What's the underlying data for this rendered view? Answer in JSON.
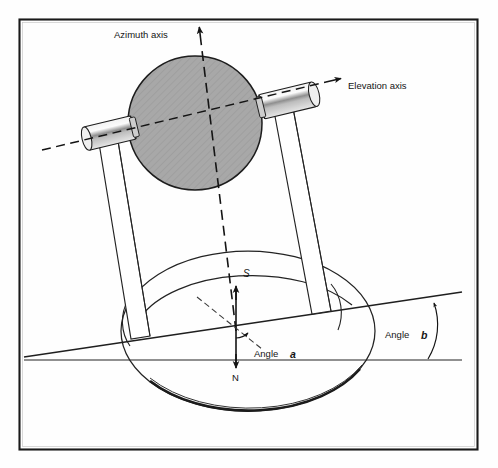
{
  "figure": {
    "type": "technical-line-diagram",
    "background_color": "#fefefe",
    "border_color": "#1a1a1a",
    "ink_color": "#141414",
    "disc_fill_color": "#a8a8a8",
    "bearing_fill_color": "#d8d8d8",
    "bearing_shade_color": "#9a9a9a"
  },
  "labels": {
    "azimuth_axis": "Azimuth axis",
    "elevation_axis": "Elevation axis",
    "angle_a": "Angle",
    "angle_a_symbol": "a",
    "angle_b": "Angle",
    "angle_b_symbol": "b",
    "south": "S",
    "north": "N"
  },
  "icons": {
    "azimuth_arrowhead": "arrow-up-icon",
    "elevation_arrowhead": "arrow-right-icon",
    "south_arrowhead": "arrow-up-icon",
    "north_arrowhead": "arrow-down-icon",
    "angle_a_arrowhead": "arc-arrow-icon",
    "angle_b_arrowhead": "arc-arrow-icon"
  },
  "geometry": {
    "frame": {
      "x": 19,
      "y": 19,
      "width": 459,
      "height": 431
    },
    "disc": {
      "cx": 195,
      "cy": 123,
      "r": 67
    },
    "base_ellipse": {
      "cx": 248,
      "cy": 331,
      "rx": 127,
      "ry": 80
    },
    "horizon_line": {
      "x1": 24,
      "y1": 360,
      "x2": 462,
      "y2": 360
    },
    "incline_line": {
      "x1": 24,
      "y1": 356,
      "x2": 462,
      "y2": 292
    },
    "azimuth_axis_angle_deg": 14,
    "elevation_axis_angle_deg": -14
  }
}
